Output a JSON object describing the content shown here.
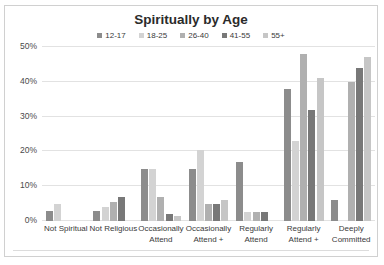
{
  "chart_data": {
    "type": "bar",
    "title": "Spiritually by Age",
    "xlabel": "",
    "ylabel": "",
    "ylim": [
      0,
      50
    ],
    "ytick_labels": [
      "0%",
      "10%",
      "20%",
      "30%",
      "40%",
      "50%"
    ],
    "ytick_values": [
      0,
      10,
      20,
      30,
      40,
      50
    ],
    "grid": true,
    "legend_position": "top",
    "categories": [
      "Not Spiritual",
      "Not Religious",
      "Occasionally Attend",
      "Occasionally Attend +",
      "Regularly Attend",
      "Regularly Attend +",
      "Deeply Committed"
    ],
    "category_lines": [
      [
        "Not Spiritual"
      ],
      [
        "Not Religious"
      ],
      [
        "Occasionally",
        "Attend"
      ],
      [
        "Occasionally",
        "Attend +"
      ],
      [
        "Regularly",
        "Attend"
      ],
      [
        "Regularly",
        "Attend +"
      ],
      [
        "Deeply",
        "Committed"
      ]
    ],
    "series": [
      {
        "name": "12-17",
        "color": "#8c8c8c",
        "values": [
          3.0,
          3.0,
          15.0,
          15.0,
          17.0,
          38.0,
          6.0
        ]
      },
      {
        "name": "18-25",
        "color": "#d3d3d3",
        "values": [
          5.0,
          4.0,
          15.0,
          20.5,
          2.5,
          23.0,
          0.0
        ]
      },
      {
        "name": "26-40",
        "color": "#b0b0b0",
        "values": [
          0.0,
          5.5,
          7.0,
          5.0,
          2.5,
          48.0,
          40.0
        ]
      },
      {
        "name": "41-55",
        "color": "#787878",
        "values": [
          0.0,
          7.0,
          2.0,
          5.0,
          2.5,
          32.0,
          44.0
        ]
      },
      {
        "name": "55+",
        "color": "#c6c6c6",
        "values": [
          0.0,
          0.0,
          1.5,
          6.0,
          0.0,
          41.0,
          47.0
        ]
      }
    ]
  }
}
